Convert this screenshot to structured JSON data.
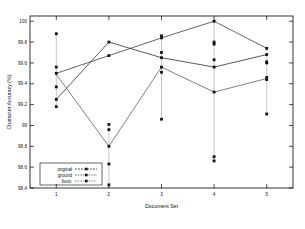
{
  "chart_data": {
    "type": "line",
    "title": "",
    "xlabel": "Document Set",
    "ylabel": "Character Accuracy (%)",
    "categories": [
      1,
      2,
      3,
      4,
      5
    ],
    "x": [
      1,
      2,
      3,
      4,
      5
    ],
    "xlim": [
      0.5,
      5.5
    ],
    "ylim": [
      98.4,
      100.05
    ],
    "yticks": [
      98.4,
      98.6,
      98.8,
      99,
      99.2,
      99.4,
      99.6,
      99.8,
      100
    ],
    "ytick_labels": [
      "98.4",
      "98.6",
      "98.8",
      "99",
      "99.2",
      "99.4",
      "99.6",
      "99.8",
      "100"
    ],
    "xticks": [
      1,
      2,
      3,
      4,
      5
    ],
    "xtick_labels": [
      "1",
      "2",
      "3",
      "4",
      "5"
    ],
    "grid": false,
    "legend_position": "lower-left",
    "series": [
      {
        "name": "original",
        "marker": "point",
        "linestyle": "solid",
        "color": "#222222",
        "values": [
          99.25,
          99.8,
          99.65,
          99.56,
          99.68
        ]
      },
      {
        "name": "ground",
        "marker": "point",
        "linestyle": "solid",
        "color": "#333333",
        "values": [
          99.5,
          99.67,
          99.84,
          100.0,
          99.74
        ]
      },
      {
        "name": "boot.",
        "marker": "square",
        "linestyle": "solid",
        "color": "#555555",
        "values": [
          99.49,
          98.8,
          99.56,
          99.32,
          99.45
        ],
        "error_bars": [
          {
            "x": 1,
            "low": 99.18,
            "high": 99.88
          },
          {
            "x": 2,
            "low": 98.43,
            "high": 99.01
          },
          {
            "x": 3,
            "low": 99.06,
            "high": 99.86
          },
          {
            "x": 4,
            "low": 98.66,
            "high": 100.0
          },
          {
            "x": 5,
            "low": 99.11,
            "high": 99.75
          }
        ]
      }
    ],
    "scatter_points": [
      {
        "x": 1,
        "y": 99.88
      },
      {
        "x": 1,
        "y": 99.56
      },
      {
        "x": 1,
        "y": 99.5
      },
      {
        "x": 1,
        "y": 99.37
      },
      {
        "x": 1,
        "y": 99.25
      },
      {
        "x": 1,
        "y": 99.18
      },
      {
        "x": 2,
        "y": 99.8
      },
      {
        "x": 2,
        "y": 99.67
      },
      {
        "x": 2,
        "y": 99.01
      },
      {
        "x": 2,
        "y": 98.96
      },
      {
        "x": 2,
        "y": 98.8
      },
      {
        "x": 2,
        "y": 98.63
      },
      {
        "x": 2,
        "y": 98.43
      },
      {
        "x": 3,
        "y": 99.86
      },
      {
        "x": 3,
        "y": 99.84
      },
      {
        "x": 3,
        "y": 99.7
      },
      {
        "x": 3,
        "y": 99.65
      },
      {
        "x": 3,
        "y": 99.56
      },
      {
        "x": 3,
        "y": 99.51
      },
      {
        "x": 3,
        "y": 99.06
      },
      {
        "x": 4,
        "y": 100.0
      },
      {
        "x": 4,
        "y": 99.8
      },
      {
        "x": 4,
        "y": 99.78
      },
      {
        "x": 4,
        "y": 99.63
      },
      {
        "x": 4,
        "y": 99.56
      },
      {
        "x": 4,
        "y": 99.32
      },
      {
        "x": 4,
        "y": 98.7
      },
      {
        "x": 4,
        "y": 98.66
      },
      {
        "x": 5,
        "y": 99.74
      },
      {
        "x": 5,
        "y": 99.68
      },
      {
        "x": 5,
        "y": 99.61
      },
      {
        "x": 5,
        "y": 99.6
      },
      {
        "x": 5,
        "y": 99.46
      },
      {
        "x": 5,
        "y": 99.44
      },
      {
        "x": 5,
        "y": 99.11
      }
    ]
  },
  "legend": {
    "entries": [
      {
        "label": "original"
      },
      {
        "label": "ground"
      },
      {
        "label": "boot."
      }
    ]
  }
}
